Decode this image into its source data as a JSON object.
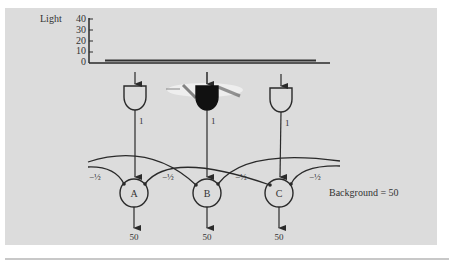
{
  "figure": {
    "light_axis": {
      "label": "Light",
      "ticks": [
        "40",
        "30",
        "20",
        "10",
        "0"
      ]
    },
    "receptors": [
      {
        "id": "r1",
        "state": "open",
        "weight": "1"
      },
      {
        "id": "r2",
        "state": "stimulated",
        "weight": "1"
      },
      {
        "id": "r3",
        "state": "open",
        "weight": "1"
      }
    ],
    "inhibition_weights": [
      "−½",
      "−½",
      "−½",
      "−½"
    ],
    "neurons": [
      {
        "label": "A",
        "output": "50"
      },
      {
        "label": "B",
        "output": "50"
      },
      {
        "label": "C",
        "output": "50"
      }
    ],
    "background_label": "Background = 50"
  },
  "colors": {
    "panel": "#dcdcdc",
    "ink": "#2a2a2a"
  }
}
